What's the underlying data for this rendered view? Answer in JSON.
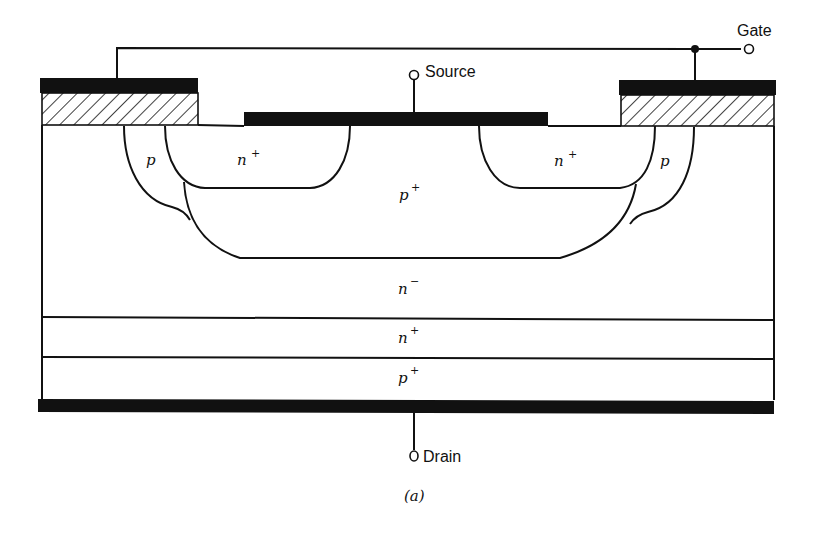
{
  "diagram": {
    "type": "IGBT cross-section",
    "terminals": {
      "gate": "Gate",
      "source": "Source",
      "drain": "Drain"
    },
    "regions": {
      "p_left": "p",
      "p_right": "p",
      "n_plus_left": "n",
      "n_plus_right": "n",
      "p_plus_body": "p",
      "n_minus_drift": "n",
      "n_plus_buffer": "n",
      "p_plus_substrate": "p"
    },
    "superscripts": {
      "n_plus_left": "+",
      "n_plus_right": "+",
      "p_plus_body": "+",
      "n_minus_drift": "−",
      "n_plus_buffer": "+",
      "p_plus_substrate": "+"
    },
    "caption": "(a)",
    "colors": {
      "ink": "#111111",
      "background": "#ffffff"
    }
  }
}
